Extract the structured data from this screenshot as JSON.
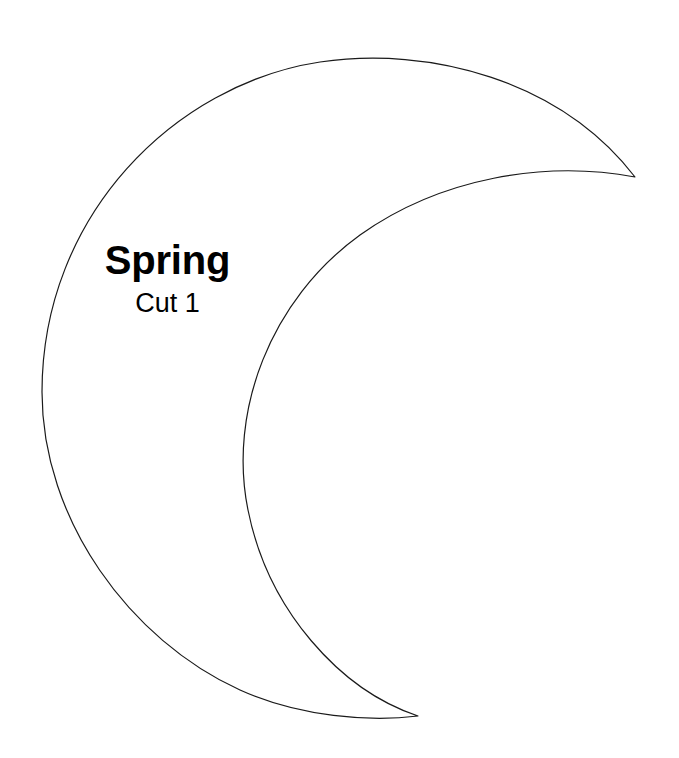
{
  "document": {
    "title": "Spring Crescent Moon Cutting Template",
    "background_color": "#ffffff",
    "width": 679,
    "height": 758
  },
  "shape": {
    "name": "crescent-moon",
    "stroke_color": "#1a1a1a",
    "fill_color": "#ffffff",
    "stroke_width": 1.2,
    "orientation": "opening-right",
    "upper_cusp": [
      635,
      177
    ],
    "lower_cusp": [
      418,
      716
    ],
    "outer_arc_leftmost": [
      42,
      390
    ],
    "outer_arc_topmost": [
      360,
      52
    ],
    "outer_arc_bottommost": [
      390,
      714
    ],
    "inner_arc_topmost": [
      510,
      158
    ],
    "inner_arc_leftmost": [
      240,
      410
    ],
    "path": "M 635 177 C 560 80, 430 46, 320 62 C 175 84, 42 215, 42 392 C 42 520, 130 640, 240 690 C 300 717, 370 722, 418 716 C 340 690, 268 610, 248 510 C 228 412, 270 300, 360 235 C 440 178, 545 160, 635 177 Z"
  },
  "labels": {
    "title": "Spring",
    "subtitle": "Cut 1",
    "title_color": "#000000",
    "subtitle_color": "#000000"
  }
}
